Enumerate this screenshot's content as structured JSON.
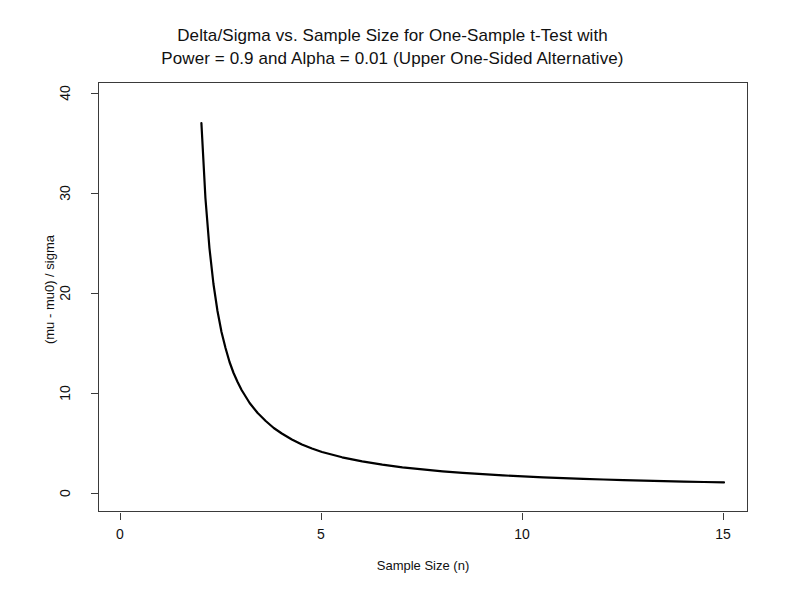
{
  "chart_data": {
    "type": "line",
    "title": "Delta/Sigma vs. Sample Size for One-Sample t-Test with\nPower = 0.9 and Alpha = 0.01 (Upper One-Sided Alternative)",
    "title_line1": "Delta/Sigma vs. Sample Size for One-Sample t-Test with",
    "title_line2": "Power = 0.9 and Alpha = 0.01 (Upper One-Sided Alternative)",
    "xlabel": "Sample Size (n)",
    "ylabel": "(mu - mu0) / sigma",
    "xlim": [
      -0.45,
      15.6
    ],
    "ylim": [
      -1.2,
      41.5
    ],
    "xticks": [
      0,
      5,
      10,
      15
    ],
    "xtick_labels": [
      "0",
      "5",
      "10",
      "15"
    ],
    "yticks": [
      0,
      10,
      20,
      30,
      40
    ],
    "ytick_labels": [
      "0",
      "10",
      "20",
      "30",
      "40"
    ],
    "grid": false,
    "legend": false,
    "line_color": "#000000",
    "line_width": 2.2,
    "series": [
      {
        "name": "delta/sigma",
        "x": [
          2,
          2.1,
          2.2,
          2.3,
          2.4,
          2.5,
          2.6,
          2.7,
          2.8,
          2.9,
          3,
          3.2,
          3.4,
          3.6,
          3.8,
          4,
          4.25,
          4.5,
          4.75,
          5,
          5.5,
          6,
          6.5,
          7,
          7.5,
          8,
          8.5,
          9,
          9.5,
          10,
          10.5,
          11,
          11.5,
          12,
          12.5,
          13,
          13.5,
          14,
          14.5,
          15
        ],
        "y": [
          37.1,
          29.6,
          24.6,
          21.0,
          18.3,
          16.2,
          14.6,
          13.2,
          12.1,
          11.2,
          10.4,
          9.1,
          8.1,
          7.3,
          6.6,
          6.05,
          5.45,
          4.95,
          4.55,
          4.2,
          3.67,
          3.26,
          2.94,
          2.67,
          2.46,
          2.27,
          2.12,
          1.98,
          1.86,
          1.76,
          1.67,
          1.59,
          1.52,
          1.45,
          1.39,
          1.34,
          1.29,
          1.24,
          1.2,
          1.16
        ]
      }
    ],
    "curve_note": "Monotonically decreasing hyperbolic-like curve; starts near 37 at n=2 and flattens toward ~1 by n=15"
  },
  "axes": {
    "y_ticks": [
      {
        "label": "40",
        "value": 40
      },
      {
        "label": "30",
        "value": 30
      },
      {
        "label": "20",
        "value": 20
      },
      {
        "label": "10",
        "value": 10
      },
      {
        "label": "0",
        "value": 0
      }
    ],
    "x_ticks": [
      {
        "label": "0",
        "value": 0
      },
      {
        "label": "5",
        "value": 5
      },
      {
        "label": "10",
        "value": 10
      },
      {
        "label": "15",
        "value": 15
      }
    ]
  }
}
